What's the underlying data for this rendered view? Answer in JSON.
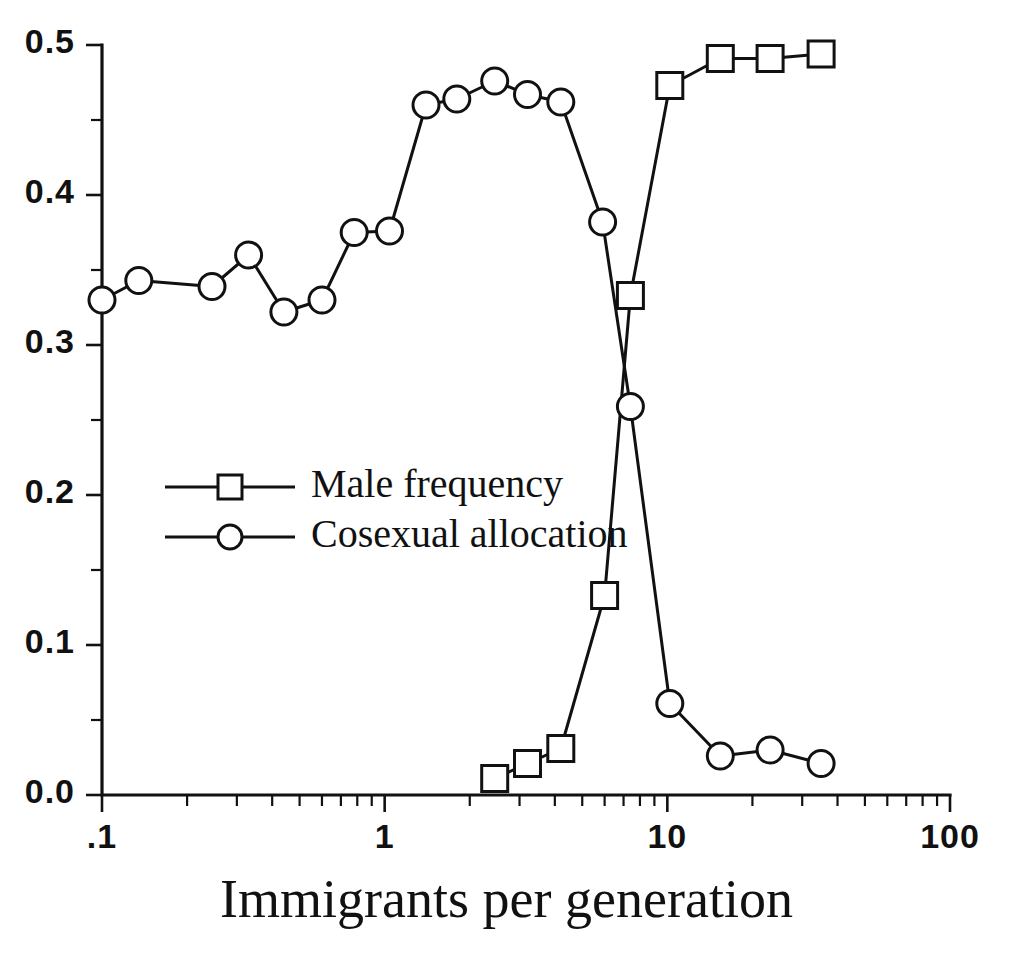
{
  "chart_data": {
    "type": "line",
    "title": "",
    "xlabel": "Immigrants per generation",
    "ylabel": "",
    "xscale": "log",
    "xlim": [
      0.1,
      100
    ],
    "ylim": [
      0.0,
      0.5
    ],
    "grid": false,
    "legend_position": "center-left",
    "xticks": [
      {
        "value": 0.1,
        "label": ".1"
      },
      {
        "value": 1,
        "label": "1"
      },
      {
        "value": 10,
        "label": "10"
      },
      {
        "value": 100,
        "label": "100"
      }
    ],
    "yticks": [
      {
        "value": 0.0,
        "label": "0.0"
      },
      {
        "value": 0.1,
        "label": "0.1"
      },
      {
        "value": 0.2,
        "label": "0.2"
      },
      {
        "value": 0.3,
        "label": "0.3"
      },
      {
        "value": 0.4,
        "label": "0.4"
      },
      {
        "value": 0.5,
        "label": "0.5"
      }
    ],
    "series": [
      {
        "name": "Male frequency",
        "marker": "square",
        "x": [
          2.45,
          3.2,
          4.2,
          6.0,
          7.4,
          10.2,
          15.4,
          23.1,
          35.0
        ],
        "values": [
          0.011,
          0.021,
          0.031,
          0.133,
          0.333,
          0.473,
          0.491,
          0.491,
          0.494
        ]
      },
      {
        "name": "Cosexual allocation",
        "marker": "circle",
        "x": [
          0.1,
          0.135,
          0.245,
          0.33,
          0.44,
          0.6,
          0.78,
          1.04,
          1.4,
          1.8,
          2.45,
          3.2,
          4.2,
          5.9,
          7.4,
          10.2,
          15.4,
          23.1,
          35.0
        ],
        "values": [
          0.33,
          0.343,
          0.339,
          0.36,
          0.322,
          0.33,
          0.375,
          0.376,
          0.46,
          0.464,
          0.476,
          0.467,
          0.462,
          0.382,
          0.259,
          0.061,
          0.026,
          0.03,
          0.021
        ]
      }
    ]
  },
  "legend": {
    "entries": [
      {
        "label": "Male frequency",
        "marker": "square"
      },
      {
        "label": "Cosexual allocation",
        "marker": "circle"
      }
    ]
  }
}
